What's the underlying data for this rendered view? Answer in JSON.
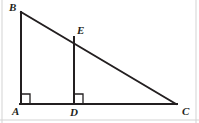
{
  "figure": {
    "type": "geometry-diagram",
    "canvas": {
      "width": 199,
      "height": 123,
      "background": "#ffffff"
    },
    "stroke_color": "#231f20",
    "stroke_width": 2,
    "border_color": "#c9c9c9",
    "points": [
      {
        "id": "B",
        "label": "B",
        "x": 21,
        "y": 12,
        "label_x": 9,
        "label_y": 2
      },
      {
        "id": "A",
        "label": "A",
        "x": 21,
        "y": 104,
        "label_x": 12,
        "label_y": 106
      },
      {
        "id": "C",
        "label": "C",
        "x": 176,
        "y": 104,
        "label_x": 182,
        "label_y": 106
      },
      {
        "id": "D",
        "label": "D",
        "x": 74,
        "y": 104,
        "label_x": 70,
        "label_y": 107
      },
      {
        "id": "E",
        "label": "E",
        "x": 74,
        "y": 38,
        "label_x": 77,
        "label_y": 25
      }
    ],
    "segments": [
      {
        "id": "AB",
        "from": "A",
        "to": "B",
        "x1": 21,
        "y1": 104,
        "x2": 21,
        "y2": 12
      },
      {
        "id": "BC",
        "from": "B",
        "to": "C",
        "x1": 21,
        "y1": 12,
        "x2": 176,
        "y2": 104
      },
      {
        "id": "AC",
        "from": "A",
        "to": "C",
        "x1": 21,
        "y1": 104,
        "x2": 176,
        "y2": 104
      },
      {
        "id": "ED",
        "from": "E",
        "to": "D",
        "x1": 74,
        "y1": 38,
        "x2": 74,
        "y2": 104
      }
    ],
    "right_angles": [
      {
        "id": "angle-A",
        "at": "A",
        "x": 21,
        "y": 94,
        "size": 9,
        "orientation": "up-right"
      },
      {
        "id": "angle-D",
        "at": "D",
        "x": 74,
        "y": 94,
        "size": 9,
        "orientation": "up-right"
      }
    ],
    "borders": {
      "left_x": 2,
      "right_x": 196,
      "bottom_y": 120
    }
  }
}
